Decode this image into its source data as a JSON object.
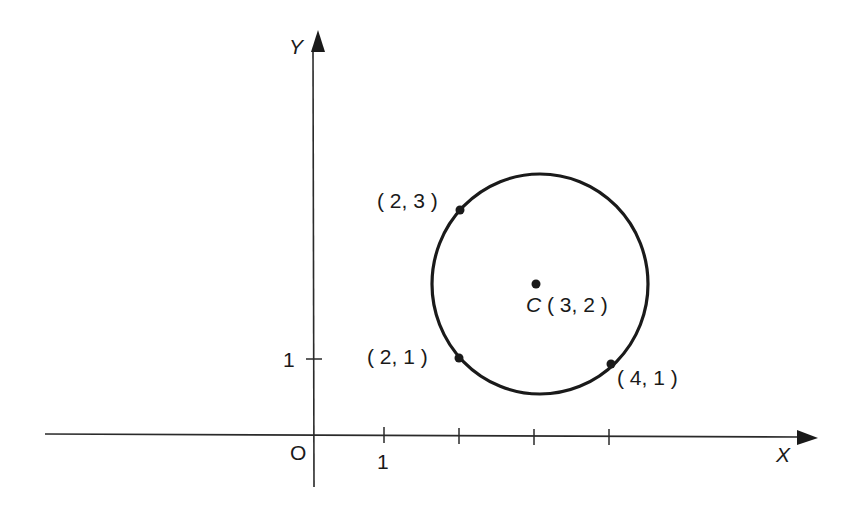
{
  "diagram": {
    "type": "coordinate-geometry-circle",
    "axes": {
      "x_label": "X",
      "y_label": "Y",
      "origin_label": "O",
      "x_tick_label": "1",
      "y_tick_label": "1"
    },
    "circle": {
      "center_name": "C",
      "center_coords": "( 3, 2 )",
      "center": [
        3,
        2
      ]
    },
    "points": [
      {
        "label": "( 2, 3 )",
        "x": 2,
        "y": 3
      },
      {
        "label": "( 2, 1 )",
        "x": 2,
        "y": 1
      },
      {
        "label": "( 4, 1 )",
        "x": 4,
        "y": 1
      }
    ],
    "colors": {
      "ink": "#1a1a1a",
      "background": "#ffffff"
    }
  }
}
